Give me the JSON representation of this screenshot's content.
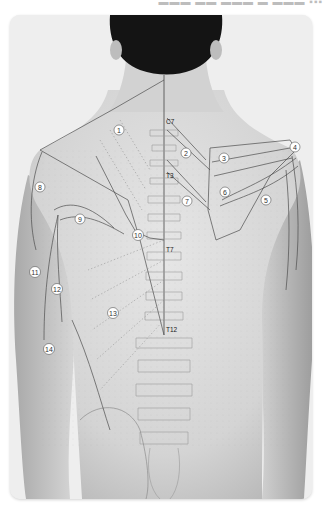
{
  "figure": {
    "view": "posterior torso",
    "vertebra_markers": [
      {
        "label": "C7",
        "x": 168,
        "y": 122
      },
      {
        "label": "T3",
        "x": 168,
        "y": 176
      },
      {
        "label": "T7",
        "x": 168,
        "y": 250
      },
      {
        "label": "T12",
        "x": 168,
        "y": 330
      }
    ],
    "muscle_labels": [
      {
        "num": "1",
        "x": 119,
        "y": 130
      },
      {
        "num": "2",
        "x": 186,
        "y": 153
      },
      {
        "num": "3",
        "x": 224,
        "y": 158
      },
      {
        "num": "4",
        "x": 295,
        "y": 147
      },
      {
        "num": "5",
        "x": 266,
        "y": 200
      },
      {
        "num": "6",
        "x": 225,
        "y": 192
      },
      {
        "num": "7",
        "x": 187,
        "y": 201
      },
      {
        "num": "8",
        "x": 40,
        "y": 187
      },
      {
        "num": "9",
        "x": 80,
        "y": 219
      },
      {
        "num": "10",
        "x": 138,
        "y": 235
      },
      {
        "num": "11",
        "x": 35,
        "y": 272
      },
      {
        "num": "12",
        "x": 57,
        "y": 289
      },
      {
        "num": "13",
        "x": 113,
        "y": 313
      },
      {
        "num": "14",
        "x": 49,
        "y": 349
      }
    ]
  }
}
